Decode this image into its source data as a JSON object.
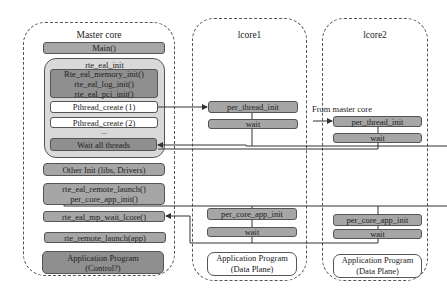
{
  "master": {
    "title": "Master core",
    "main": "Main()",
    "eal_group": {
      "title": "rte_eal_init",
      "init_lines": [
        "Rte_eal_memory_init()",
        "rte_eal_log_init()",
        "rte_eal_pci_init()"
      ],
      "pthread1": "Pthread_create (1)",
      "pthread2": "Pthread_create (2)",
      "ellipsis": "...",
      "wait_all": "Wait all threads"
    },
    "other_init": "Other Init (libs, Drivers)",
    "remote_launch": [
      "rte_eal_remote_launch()",
      "per_core_app_init()"
    ],
    "mp_wait": "rte_eal_mp_wait_lcore()",
    "remote_launch_app": "rte_remote_launch(app)",
    "app": [
      "Application Program",
      "(Control?)"
    ]
  },
  "lcore1": {
    "title": "lcore1",
    "per_thread_init": "per_thread_init",
    "wait1": "wait",
    "per_core_app_init": "per_core_app_init",
    "wait2": "wait",
    "app": [
      "Application Program",
      "(Data Plane)"
    ]
  },
  "lcore2": {
    "title": "lcore2",
    "from_label": "From master core",
    "per_thread_init": "per_thread_init",
    "wait1": "wait",
    "per_core_app_init": "per_core_app_init",
    "wait2": "wait",
    "app": [
      "Application Program",
      "(Data Plane)"
    ]
  }
}
